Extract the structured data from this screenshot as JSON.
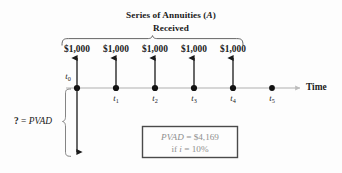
{
  "figure": {
    "title": {
      "line1_prefix": "Series of Annuities (",
      "line1_italic": "A",
      "line1_suffix": ")",
      "line1_full": "Series of Annuities (A)",
      "line2": "Received"
    },
    "cash_flow_label": "$1,000",
    "cash_flows": [
      {
        "period": "t0",
        "label": "$1,000",
        "amount": 1000,
        "x": 77
      },
      {
        "period": "t1",
        "label": "$1,000",
        "amount": 1000,
        "x": 116
      },
      {
        "period": "t2",
        "label": "$1,000",
        "amount": 1000,
        "x": 155
      },
      {
        "period": "t3",
        "label": "$1,000",
        "amount": 1000,
        "x": 194
      },
      {
        "period": "t4",
        "label": "$1,000",
        "amount": 1000,
        "x": 233
      }
    ],
    "timeline": {
      "axis_label": "Time",
      "ticks": [
        {
          "base": "t",
          "sub": "0",
          "x": 77
        },
        {
          "base": "t",
          "sub": "1",
          "x": 116
        },
        {
          "base": "t",
          "sub": "2",
          "x": 155
        },
        {
          "base": "t",
          "sub": "3",
          "x": 194
        },
        {
          "base": "t",
          "sub": "4",
          "x": 233
        },
        {
          "base": "t",
          "sub": "5",
          "x": 272
        }
      ]
    },
    "pvad_bracket_label": {
      "question": "?",
      "equals": "=",
      "term": "PVAD",
      "full": "? = PVAD"
    },
    "result_box": {
      "line1_term": "PVAD",
      "line1_equals": "=",
      "line1_value": "$4,169",
      "line1_full": "PVAD = $4,169",
      "line2_prefix": "if",
      "line2_symbol": "i",
      "line2_equals": "=",
      "line2_rate": "10%",
      "line2_full": "if i = 10%"
    },
    "colors": {
      "ink": "#1a1a1a",
      "axis": "#c9c9c9",
      "brace": "#4a4a4a",
      "box_border": "#4a4a4a",
      "box_text": "#8f8f8f",
      "background": "#fdfdfd"
    }
  }
}
